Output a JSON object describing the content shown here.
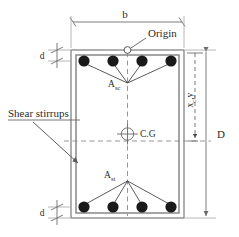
{
  "figure": {
    "kind": "reinforced-concrete-beam-cross-section",
    "colors": {
      "background": "#ffffff",
      "outline": "#6e6e6e",
      "stirrup": "#8a8a8a",
      "rebar": "#1a1a1a",
      "dimension": "#6e6e6e",
      "centerline": "#8a8a8a",
      "text": "#2b2b2b",
      "leader": "#555555"
    },
    "labels": {
      "width": "b",
      "depth": "D",
      "cover_top": "d",
      "cover_bottom": "d",
      "origin": "Origin",
      "centroid": "C.G",
      "steel_compression_base": "A",
      "steel_compression_sub": "sc",
      "steel_tension_base": "A",
      "steel_tension_sub": "st",
      "shear_stirrups": "Shear stirrups",
      "centroid_distance_base": "x",
      "centroid_distance_sub": "c",
      "centroid_distance_tail": ",y"
    },
    "reinforcement": {
      "top_bar_count": 4,
      "bottom_bar_count": 4,
      "bar_radius": 5.6,
      "top_bar_x": [
        84,
        113,
        142,
        171
      ],
      "top_bar_y": 61,
      "bottom_bar_x": [
        84,
        113,
        142,
        171
      ],
      "bottom_bar_y": 207
    },
    "geometry": {
      "outer": {
        "x": 71,
        "y": 50,
        "width": 113,
        "height": 168
      },
      "stirrup": {
        "x": 76,
        "y": 55,
        "width": 103,
        "height": 158
      },
      "origin_point": {
        "x": 127.5,
        "y": 50
      },
      "centroid_point": {
        "x": 127.5,
        "y": 134
      },
      "asc_apex": {
        "x": 127.5,
        "y": 83
      },
      "ast_apex": {
        "x": 127.5,
        "y": 181
      }
    }
  }
}
